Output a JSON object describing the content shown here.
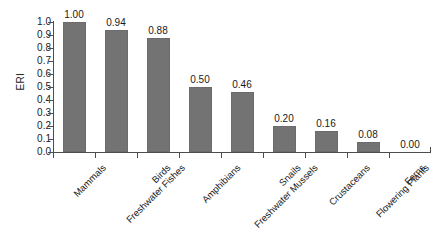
{
  "chart_data": {
    "type": "bar",
    "title": "",
    "xlabel": "",
    "ylabel": "ERI",
    "ylim": [
      0.0,
      1.0
    ],
    "grid": false,
    "legend": "none",
    "bar_color": "#737373",
    "categories": [
      "Mammals",
      "Freshwater Fishes",
      "Birds",
      "Amphibians",
      "Freshwater Mussels",
      "Snails",
      "Crustaceans",
      "Flowering Plants",
      "Ferns"
    ],
    "values": [
      1.0,
      0.94,
      0.88,
      0.5,
      0.46,
      0.2,
      0.16,
      0.08,
      0.0
    ],
    "value_labels": [
      "1.00",
      "0.94",
      "0.88",
      "0.50",
      "0.46",
      "0.20",
      "0.16",
      "0.08",
      "0.00"
    ],
    "y_ticks": [
      1.0,
      0.9,
      0.8,
      0.7,
      0.6,
      0.5,
      0.4,
      0.3,
      0.2,
      0.1,
      0.0
    ],
    "y_tick_labels": [
      "1.0",
      "0.9",
      "0.8",
      "0.7",
      "0.6",
      "0.5",
      "0.4",
      "0.3",
      "0.2",
      "0.1",
      "0.0"
    ]
  }
}
